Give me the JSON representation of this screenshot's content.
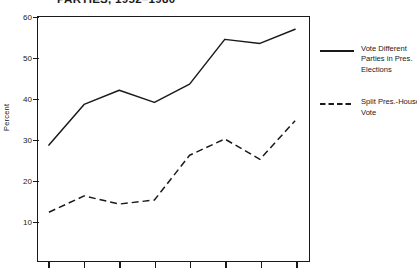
{
  "chart_data": {
    "type": "line",
    "title": "PARTIES, 1952–1980",
    "xlabel": "",
    "ylabel": "Percent",
    "ylim": [
      0,
      60
    ],
    "yticks": [
      10,
      20,
      30,
      40,
      50,
      60
    ],
    "ytick_labels": [
      "10",
      "20",
      "30",
      "40",
      "50",
      "60"
    ],
    "x": [
      1952,
      1956,
      1960,
      1964,
      1968,
      1972,
      1976,
      1980
    ],
    "xtick_labels": [
      "",
      "",
      "",
      "",
      "",
      "",
      "",
      ""
    ],
    "grid": false,
    "legend_position": "right",
    "series": [
      {
        "name": "Vote Different Parties in Pres. Elections",
        "style": "solid",
        "color": "#1a1a1a",
        "values": [
          28.5,
          38.5,
          42.0,
          39.0,
          43.5,
          54.5,
          53.5,
          57.0
        ]
      },
      {
        "name": "Split Pres.-House Vote",
        "style": "dashed",
        "color": "#1a1a1a",
        "values": [
          12.0,
          16.0,
          14.0,
          15.0,
          26.0,
          30.0,
          25.0,
          34.5
        ]
      }
    ]
  },
  "figure": {
    "title": "PARTIES, 1952–1980",
    "ylabel": "Percent"
  },
  "legend": {
    "entries": [
      {
        "id": "vote-different-parties",
        "style": "solid",
        "lines": [
          "Vote Different",
          "Parties in Pres.",
          "Elections"
        ]
      },
      {
        "id": "split-pres-house-vote",
        "style": "dashed",
        "lines": [
          "Split Pres.-House",
          "Vote"
        ]
      }
    ]
  }
}
